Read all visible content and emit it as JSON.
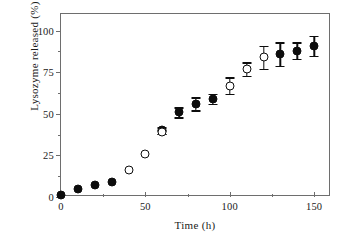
{
  "chart_data": {
    "type": "scatter",
    "title": "",
    "xlabel": "Time (h)",
    "ylabel": "Lysozyme released (%)",
    "xlim": [
      0,
      160
    ],
    "ylim": [
      0,
      110
    ],
    "xticks": [
      0,
      50,
      100,
      150
    ],
    "yticks": [
      0,
      25,
      50,
      75,
      100
    ],
    "xtick_labels": [
      "0",
      "50",
      "100",
      "150"
    ],
    "ytick_labels": [
      "0",
      "25",
      "50",
      "75",
      "100"
    ],
    "x_minor_ticks": [
      25,
      75,
      125
    ],
    "y_minor_ticks": [
      12.5,
      37.5,
      62.5,
      87.5
    ],
    "grid": false,
    "legend": "none",
    "marker_colors": {
      "filled": "#0d0d0d",
      "open": "#ffffff",
      "edge": "#0d0d0d",
      "axis": "#6e6e6e"
    },
    "series": [
      {
        "name": "filled-circles",
        "marker": "filled",
        "points": [
          {
            "x": 0,
            "y": 1,
            "err": 0
          },
          {
            "x": 10,
            "y": 5,
            "err": 0
          },
          {
            "x": 20,
            "y": 7,
            "err": 0
          },
          {
            "x": 30,
            "y": 9,
            "err": 0
          },
          {
            "x": 60,
            "y": 40,
            "err": 2
          },
          {
            "x": 70,
            "y": 51,
            "err": 3
          },
          {
            "x": 80,
            "y": 56,
            "err": 4
          },
          {
            "x": 90,
            "y": 59,
            "err": 3
          },
          {
            "x": 130,
            "y": 86,
            "err": 7
          },
          {
            "x": 140,
            "y": 88,
            "err": 5
          },
          {
            "x": 150,
            "y": 91,
            "err": 6
          }
        ]
      },
      {
        "name": "open-circles",
        "marker": "open",
        "points": [
          {
            "x": 40,
            "y": 16,
            "err": 0
          },
          {
            "x": 50,
            "y": 26,
            "err": 0
          },
          {
            "x": 60,
            "y": 39,
            "err": 1
          },
          {
            "x": 100,
            "y": 67,
            "err": 5
          },
          {
            "x": 110,
            "y": 77,
            "err": 4
          },
          {
            "x": 120,
            "y": 84,
            "err": 7
          }
        ]
      }
    ]
  }
}
